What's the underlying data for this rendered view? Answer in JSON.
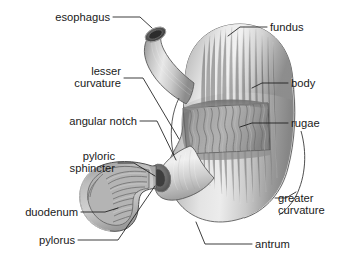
{
  "figure": {
    "background_color": "#ffffff",
    "label_color": "#1a1a1a",
    "leader_line_color": "#1a1a1a"
  },
  "labels": {
    "esophagus": "esophagus",
    "fundus": "fundus",
    "lesser_curvature_line1": "lesser",
    "lesser_curvature_line2": "curvature",
    "body": "body",
    "angular_notch": "angular notch",
    "rugae": "rugae",
    "pyloric_sphincter_line1": "pyloric",
    "pyloric_sphincter_line2": "sphincter",
    "duodenum": "duodenum",
    "greater_curvature_line1": "greater",
    "greater_curvature_line2": "curvature",
    "pylorus": "pylorus",
    "antrum": "antrum"
  },
  "structures": {
    "esophagus": {
      "name": "esophagus",
      "fill": "#b8b8b8"
    },
    "fundus": {
      "name": "fundus",
      "fill": "#d8d8d8"
    },
    "body": {
      "name": "body",
      "fill": "#c8c8c8"
    },
    "antrum": {
      "name": "antrum",
      "fill": "#c2c2c2"
    },
    "rugae": {
      "name": "rugae",
      "fill": "#9a9a9a"
    },
    "pyloric_sphincter": {
      "name": "pyloric sphincter",
      "fill": "#6a6a6a"
    },
    "duodenum": {
      "name": "duodenum",
      "fill": "#b0b0b0"
    },
    "pylorus": {
      "name": "pylorus",
      "fill": "#7a7a7a"
    },
    "greater_curvature": {
      "name": "greater curvature",
      "fill": "none"
    },
    "lesser_curvature": {
      "name": "lesser curvature",
      "fill": "none"
    },
    "angular_notch": {
      "name": "angular notch",
      "fill": "none"
    }
  }
}
